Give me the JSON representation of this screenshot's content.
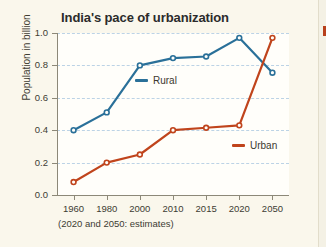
{
  "chart_data": {
    "type": "line",
    "title": "India's pace of urbanization",
    "xlabel": "",
    "ylabel": "Population in billion",
    "categories": [
      "1960",
      "1980",
      "2000",
      "2010",
      "2015",
      "2020",
      "2050"
    ],
    "ylim": [
      0.0,
      1.0
    ],
    "yticks": [
      "1.0",
      "0.8",
      "0.6",
      "0.4",
      "0.2",
      "0.0"
    ],
    "ytick_values": [
      1.0,
      0.8,
      0.6,
      0.4,
      0.2,
      0.0
    ],
    "grid": true,
    "legend_position": "inline",
    "annotation": "(2020 and 2050: estimates)",
    "series": [
      {
        "name": "Rural",
        "color": "#2a7099",
        "values": [
          0.4,
          0.51,
          0.8,
          0.845,
          0.855,
          0.97,
          0.755
        ]
      },
      {
        "name": "Urban",
        "color": "#c0441c",
        "values": [
          0.08,
          0.2,
          0.25,
          0.4,
          0.415,
          0.43,
          0.97
        ]
      }
    ]
  },
  "figure": {
    "background_color": "#faf7ec",
    "plot_background_color": "#fffefa",
    "grid_color": "#bcd3e6",
    "axis_color": "#8c8878"
  }
}
